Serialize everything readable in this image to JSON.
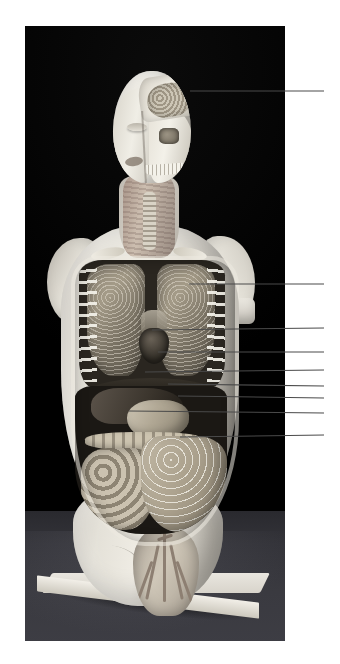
{
  "figure": {
    "type": "photograph",
    "caption": "",
    "background_color": "#000000",
    "plate": {
      "x": 25,
      "y": 26,
      "width": 260,
      "height": 615
    },
    "page_background": "#ffffff"
  },
  "model": {
    "description": "Half-dissected plaster anatomical torso model on a white rectangular stand",
    "parts": [
      {
        "name": "brain",
        "region": "head"
      },
      {
        "name": "skull",
        "region": "head"
      },
      {
        "name": "face",
        "region": "head"
      },
      {
        "name": "trachea",
        "region": "neck"
      },
      {
        "name": "lung-left",
        "region": "thorax"
      },
      {
        "name": "lung-right",
        "region": "thorax"
      },
      {
        "name": "heart",
        "region": "thorax"
      },
      {
        "name": "diaphragm",
        "region": "thorax"
      },
      {
        "name": "liver",
        "region": "abdomen"
      },
      {
        "name": "stomach",
        "region": "abdomen"
      },
      {
        "name": "transverse-colon",
        "region": "abdomen"
      },
      {
        "name": "small-intestine",
        "region": "abdomen"
      },
      {
        "name": "greater-omentum",
        "region": "abdomen"
      },
      {
        "name": "pelvis",
        "region": "pelvis"
      },
      {
        "name": "base",
        "region": "stand"
      }
    ]
  },
  "leader_lines": {
    "color": "#4a4a4a",
    "label_text": "",
    "items": [
      {
        "id": "leader-1",
        "target": "brain",
        "x1": 190,
        "y1": 91,
        "x2": 324,
        "y2": 91
      },
      {
        "id": "leader-2",
        "target": "lung",
        "x1": 189,
        "y1": 284,
        "x2": 324,
        "y2": 284
      },
      {
        "id": "leader-3",
        "target": "heart",
        "x1": 152,
        "y1": 330,
        "x2": 324,
        "y2": 328
      },
      {
        "id": "leader-4",
        "target": "diaphragm",
        "x1": 158,
        "y1": 352,
        "x2": 324,
        "y2": 352
      },
      {
        "id": "leader-5",
        "target": "liver-stomach",
        "x1": 145,
        "y1": 372,
        "x2": 324,
        "y2": 370
      },
      {
        "id": "leader-6",
        "target": "stomach",
        "x1": 168,
        "y1": 384,
        "x2": 324,
        "y2": 386
      },
      {
        "id": "leader-7",
        "target": "transverse-colon",
        "x1": 178,
        "y1": 396,
        "x2": 324,
        "y2": 398
      },
      {
        "id": "leader-8",
        "target": "colon-flexure",
        "x1": 129,
        "y1": 411,
        "x2": 324,
        "y2": 413
      },
      {
        "id": "leader-9",
        "target": "greater-omentum",
        "x1": 180,
        "y1": 437,
        "x2": 324,
        "y2": 435
      }
    ]
  }
}
